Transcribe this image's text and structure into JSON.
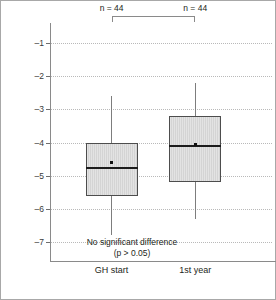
{
  "axis": {
    "y_title": "Height – MPH SDS (Prader)",
    "y_ticks": [
      "–1",
      "–2",
      "–3",
      "–4",
      "–5",
      "–6",
      "–7"
    ]
  },
  "groups": [
    {
      "category": "GH start",
      "n_label": "n = 44"
    },
    {
      "category": "1st year",
      "n_label": "n = 44"
    }
  ],
  "annotation": {
    "line1": "No significant difference",
    "line2": "(p > 0.05)"
  },
  "chart_data": {
    "type": "box",
    "title": "",
    "xlabel": "",
    "ylabel": "Height – MPH SDS (Prader)",
    "ylim": [
      -7.6,
      -0.4
    ],
    "yticks": [
      -1,
      -2,
      -3,
      -4,
      -5,
      -6,
      -7
    ],
    "grid": true,
    "legend": "none",
    "categories": [
      "GH start",
      "1st year"
    ],
    "n": [
      44,
      44
    ],
    "boxes": [
      {
        "category": "GH start",
        "n": 44,
        "whisker_high": -2.6,
        "q3": -4.0,
        "median": -4.78,
        "mean": -4.6,
        "q1": -5.6,
        "whisker_low": -6.8
      },
      {
        "category": "1st year",
        "n": 44,
        "whisker_high": -2.2,
        "q3": -3.2,
        "median": -4.12,
        "mean": -4.05,
        "q1": -5.2,
        "whisker_low": -6.3
      }
    ],
    "annotations": [
      "No significant difference",
      "(p > 0.05)"
    ],
    "significance_bracket": {
      "from": "GH start",
      "to": "1st year",
      "label": ""
    }
  },
  "colors": {
    "box_fill": "#ddd d",
    "box_edge": "#4d4d4d",
    "median": "#1c1c1c",
    "grid": "#b9b9b9",
    "axis": "#8a8a8a",
    "text": "#231f20"
  }
}
